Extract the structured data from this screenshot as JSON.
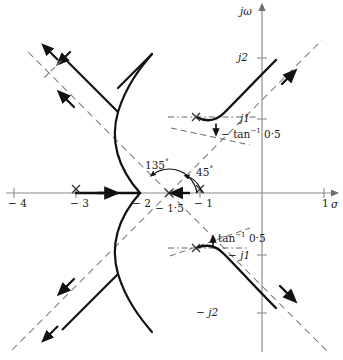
{
  "figure": {
    "kind": "root-locus-diagram",
    "axes": {
      "real_axis_label": "σ",
      "imag_axis_label": "jω",
      "x_ticks": [
        {
          "value": -4,
          "label": "− 4",
          "px": 14
        },
        {
          "value": -3,
          "label": "− 3",
          "px": 76
        },
        {
          "value": -2,
          "label": "− 2",
          "px": 138
        },
        {
          "value": -1,
          "label": "− 1",
          "px": 200
        },
        {
          "value": 1,
          "label": "1",
          "px": 324
        }
      ],
      "y_ticks": [
        {
          "value": 2,
          "label": "j2",
          "px": 58
        },
        {
          "value": 1,
          "label": "j1",
          "px": 119
        },
        {
          "value": -1,
          "label": "− j1",
          "px": 255
        },
        {
          "value": -2,
          "label": "− j2",
          "px": 313
        }
      ],
      "origin_px": {
        "x": 262,
        "y": 193
      },
      "unit_px": 62
    },
    "poles": [
      {
        "name": "pole-real",
        "sigma": -3,
        "jomega": 0,
        "marker": "x"
      },
      {
        "name": "pole-complex-upper",
        "sigma": -1,
        "jomega": 1,
        "marker": "x"
      },
      {
        "name": "pole-complex-lower",
        "sigma": -1,
        "jomega": -1,
        "marker": "x"
      }
    ],
    "centroid": {
      "sigma": -1.5,
      "label": "− 1·5"
    },
    "annotations": [
      {
        "name": "angle-135",
        "text": "135",
        "degree_symbol": "°",
        "value_deg": 135
      },
      {
        "name": "angle-45",
        "text": "45",
        "degree_symbol": "°",
        "value_deg": 45
      },
      {
        "name": "departure-angle-upper",
        "prefix": "− tan",
        "exponent": "−1",
        "value": "0·5"
      },
      {
        "name": "departure-angle-lower",
        "prefix": "tan",
        "exponent": "−1",
        "value": "0·5"
      }
    ],
    "asymptote_angles_deg": [
      45,
      135,
      225,
      315
    ],
    "colors": {
      "locus": "#111111",
      "axis": "#8a8a8a",
      "asymptote": "#7a7a7a",
      "text": "#1a1a1a"
    }
  }
}
